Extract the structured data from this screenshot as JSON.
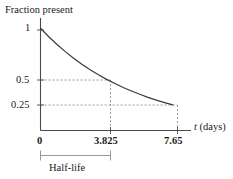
{
  "chart_data": {
    "type": "line",
    "title": "",
    "ylabel": "Fraction present",
    "xlabel": "t (days)",
    "xlabel_variable": "t",
    "xlabel_units": "(days)",
    "x": [
      0,
      0.478,
      0.956,
      1.434,
      1.913,
      2.391,
      2.869,
      3.347,
      3.825,
      4.303,
      4.781,
      5.259,
      5.738,
      6.216,
      6.694,
      7.172,
      7.65
    ],
    "values": [
      1,
      0.917,
      0.841,
      0.771,
      0.707,
      0.648,
      0.595,
      0.545,
      0.5,
      0.459,
      0.42,
      0.386,
      0.354,
      0.324,
      0.297,
      0.273,
      0.25
    ],
    "xlim": [
      0,
      8.7
    ],
    "ylim": [
      0,
      1.1
    ],
    "xticks": [
      0,
      3.825,
      7.65
    ],
    "xtick_labels": [
      "0",
      "3.825",
      "7.65"
    ],
    "yticks": [
      0.25,
      0.5,
      1
    ],
    "ytick_labels": [
      "0.25",
      "0.5",
      "1"
    ],
    "grid": false,
    "legend": null,
    "annotations": [
      {
        "name": "half-life-bracket",
        "label": "Half-life",
        "from_x": 0,
        "to_x": 3.825
      },
      {
        "name": "guide-half",
        "label": "",
        "x": 3.825,
        "y": 0.5
      },
      {
        "name": "guide-quarter",
        "label": "",
        "x": 7.65,
        "y": 0.25
      }
    ],
    "decay_constant": 0.1812,
    "half_life": 3.825,
    "colors": {
      "curve": "#3a3a3a",
      "axis": "#4a4a4a",
      "guide": "#8c8c8c",
      "text": "#1a1a1a",
      "background": "#ffffff"
    }
  },
  "axis_title_y": "Fraction present",
  "tick_y_1": "1",
  "tick_y_05": "0.5",
  "tick_y_025": "0.25",
  "tick_x_0": "0",
  "tick_x_mid": "3.825",
  "tick_x_end": "7.65",
  "axis_x_variable": "t",
  "axis_x_units": "(days)",
  "bracket_label": "Half-life"
}
